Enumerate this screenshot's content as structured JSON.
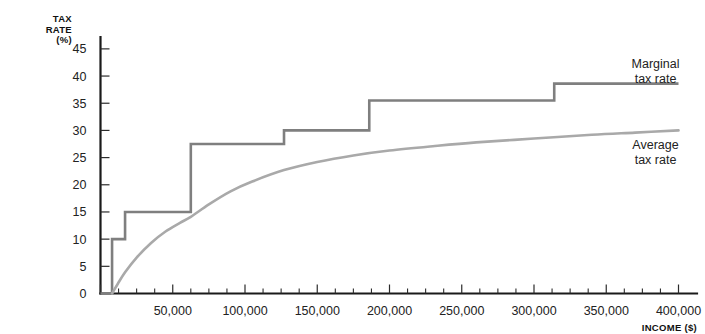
{
  "chart_data": {
    "type": "line",
    "title": "",
    "subtitle": "",
    "xlabel": "INCOME ($)",
    "ylabel": "TAX RATE (%)",
    "xlim": [
      0,
      400000
    ],
    "ylim": [
      0,
      47
    ],
    "grid": false,
    "legend_position": "inline-right",
    "x_ticks": [
      0,
      50000,
      100000,
      150000,
      200000,
      250000,
      300000,
      350000,
      400000
    ],
    "x_tick_labels": [
      "0",
      "50,000",
      "100,000",
      "150,000",
      "200,000",
      "250,000",
      "300,000",
      "350,000",
      "400,000"
    ],
    "x_minor_tick_step": 12500,
    "y_ticks": [
      0,
      5,
      10,
      15,
      20,
      25,
      30,
      35,
      40,
      45
    ],
    "y_tick_labels": [
      "0",
      "5",
      "10",
      "15",
      "20",
      "25",
      "30",
      "35",
      "40",
      "45"
    ],
    "series": [
      {
        "name": "Marginal tax rate",
        "label_lines": [
          "Marginal",
          "tax rate"
        ],
        "style": "step",
        "color": "#7f7f7f",
        "label_x": 400000,
        "label_y": 41.5,
        "brackets": [
          {
            "income_from": 0,
            "income_to": 8000,
            "rate": 0.0
          },
          {
            "income_from": 8000,
            "income_to": 17000,
            "rate": 10.0
          },
          {
            "income_from": 17000,
            "income_to": 62500,
            "rate": 15.0
          },
          {
            "income_from": 62500,
            "income_to": 127000,
            "rate": 27.5
          },
          {
            "income_from": 127000,
            "income_to": 186000,
            "rate": 30.0
          },
          {
            "income_from": 186000,
            "income_to": 314000,
            "rate": 35.5
          },
          {
            "income_from": 314000,
            "income_to": 400000,
            "rate": 38.6
          }
        ]
      },
      {
        "name": "Average tax rate",
        "label_lines": [
          "Average",
          "tax rate"
        ],
        "style": "curve",
        "color": "#a9a9a9",
        "label_x": 400000,
        "label_y": 26.5,
        "points": [
          {
            "x": 8000,
            "y": 0.0
          },
          {
            "x": 12000,
            "y": 1.8
          },
          {
            "x": 17000,
            "y": 3.9
          },
          {
            "x": 25000,
            "y": 6.6
          },
          {
            "x": 35000,
            "y": 9.3
          },
          {
            "x": 45000,
            "y": 11.4
          },
          {
            "x": 55000,
            "y": 13.0
          },
          {
            "x": 62500,
            "y": 14.1
          },
          {
            "x": 75000,
            "y": 16.4
          },
          {
            "x": 90000,
            "y": 18.8
          },
          {
            "x": 105000,
            "y": 20.6
          },
          {
            "x": 127000,
            "y": 22.7
          },
          {
            "x": 150000,
            "y": 24.2
          },
          {
            "x": 175000,
            "y": 25.4
          },
          {
            "x": 200000,
            "y": 26.3
          },
          {
            "x": 230000,
            "y": 27.1
          },
          {
            "x": 260000,
            "y": 27.8
          },
          {
            "x": 300000,
            "y": 28.5
          },
          {
            "x": 340000,
            "y": 29.2
          },
          {
            "x": 370000,
            "y": 29.6
          },
          {
            "x": 400000,
            "y": 30.0
          }
        ]
      }
    ]
  },
  "axes": {
    "y_axis_title_lines": [
      "TAX",
      "RATE",
      "(%)"
    ],
    "x_axis_title": "INCOME ($)"
  }
}
